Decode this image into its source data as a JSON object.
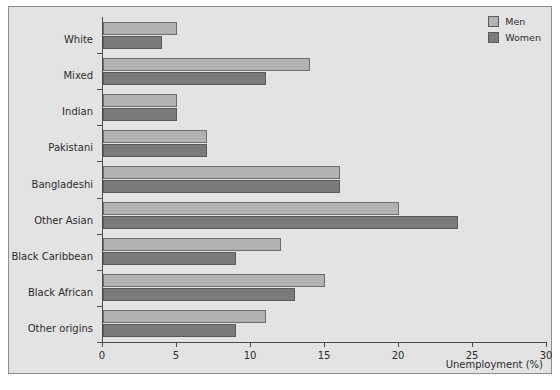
{
  "chart_data": {
    "type": "bar",
    "orientation": "horizontal",
    "title": "",
    "xlabel": "Unemployment (%)",
    "ylabel": "",
    "xlim": [
      0,
      30
    ],
    "xticks": [
      0,
      5,
      10,
      15,
      20,
      25,
      30
    ],
    "grid": false,
    "legend_position": "top-right",
    "categories": [
      "White",
      "Mixed",
      "Indian",
      "Pakistani",
      "Bangladeshi",
      "Other Asian",
      "Black Caribbean",
      "Black African",
      "Other origins"
    ],
    "series": [
      {
        "name": "Men",
        "color": "#b2b2b2",
        "values": [
          5,
          14,
          5,
          7,
          16,
          20,
          12,
          15,
          11
        ]
      },
      {
        "name": "Women",
        "color": "#7b7b7b",
        "values": [
          4,
          11,
          5,
          7,
          16,
          24,
          9,
          13,
          9
        ]
      }
    ]
  },
  "legend": {
    "items": [
      {
        "label": "Men",
        "color": "#b2b2b2"
      },
      {
        "label": "Women",
        "color": "#7b7b7b"
      }
    ]
  },
  "colors": {
    "figure_background": "#e3e3e3",
    "page_background": "#ffffff",
    "frame_border": "#8e8e8e",
    "axis": "#4a4a4a",
    "text": "#2b2b2b",
    "men_bar": "#b2b2b2",
    "women_bar": "#7b7b7b"
  }
}
